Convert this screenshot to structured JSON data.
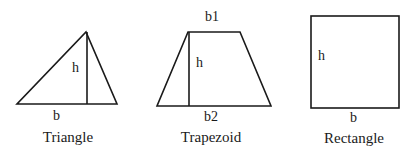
{
  "diagram": {
    "shapes": [
      {
        "id": "triangle",
        "caption": "Triangle",
        "labels": {
          "height": "h",
          "base": "b"
        },
        "points": {
          "base_left": [
            17,
            104
          ],
          "base_right": [
            117,
            104
          ],
          "apex": [
            86,
            32
          ]
        },
        "height_line": {
          "x": 87,
          "y1": 32,
          "y2": 104
        }
      },
      {
        "id": "trapezoid",
        "caption": "Trapezoid",
        "labels": {
          "top_base": "b1",
          "height": "h",
          "bottom_base": "b2"
        },
        "points": {
          "top_left": [
            188,
            32
          ],
          "top_right": [
            240,
            32
          ],
          "bottom_right": [
            271,
            106
          ],
          "bottom_left": [
            157,
            106
          ]
        },
        "height_line": {
          "x": 189,
          "y1": 32,
          "y2": 106
        }
      },
      {
        "id": "rectangle",
        "caption": "Rectangle",
        "labels": {
          "height": "h",
          "base": "b"
        },
        "points": {
          "left": 311,
          "top": 16,
          "right": 399,
          "bottom": 108
        }
      }
    ],
    "colors": {
      "stroke": "#1a1a1a",
      "background": "#ffffff"
    }
  }
}
